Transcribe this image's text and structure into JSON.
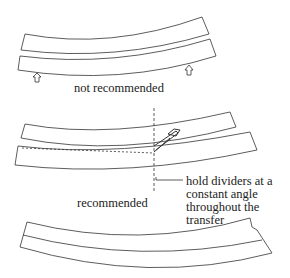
{
  "diagram": {
    "panels": [
      {
        "id": "not-recommended",
        "label": "not recommended",
        "markers": [
          "arrow-up",
          "arrow-up"
        ]
      },
      {
        "id": "recommended",
        "label": "recommended",
        "annotation": "hold dividers at a constant angle throughout the transfer",
        "annotation_lines": [
          "hold dividers at a",
          "constant angle",
          "throughout the",
          "transfer"
        ]
      },
      {
        "id": "result",
        "label": ""
      }
    ],
    "colors": {
      "stroke": "#333333",
      "background": "#ffffff"
    }
  }
}
